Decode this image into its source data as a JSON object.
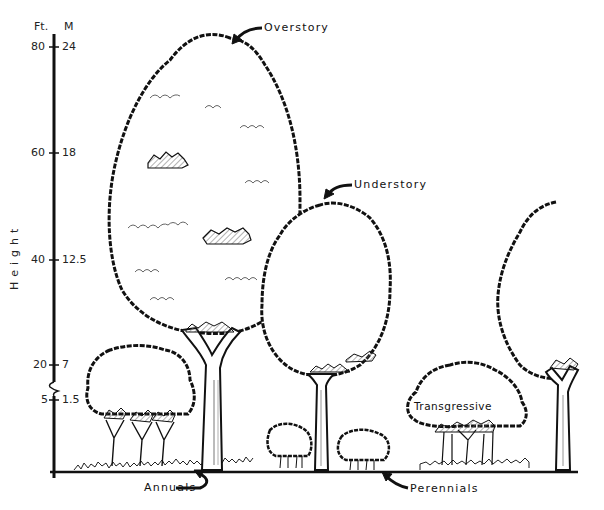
{
  "axis": {
    "title": "Height",
    "unit_ft": "Ft.",
    "unit_m": "M",
    "ticks": [
      {
        "ft": "80",
        "m": "24"
      },
      {
        "ft": "60",
        "m": "18"
      },
      {
        "ft": "40",
        "m": "12.5"
      },
      {
        "ft": "20",
        "m": "7"
      },
      {
        "ft": "5",
        "m": "1.5"
      }
    ],
    "break_symbol": "axis-break"
  },
  "labels": {
    "overstory": "Overstory",
    "understory": "Understory",
    "transgressive": "Transgressive",
    "annuals": "Annuals",
    "perennials": "Perennials"
  },
  "colors": {
    "ink": "#111111",
    "background": "#ffffff",
    "hatch": "#888888"
  }
}
